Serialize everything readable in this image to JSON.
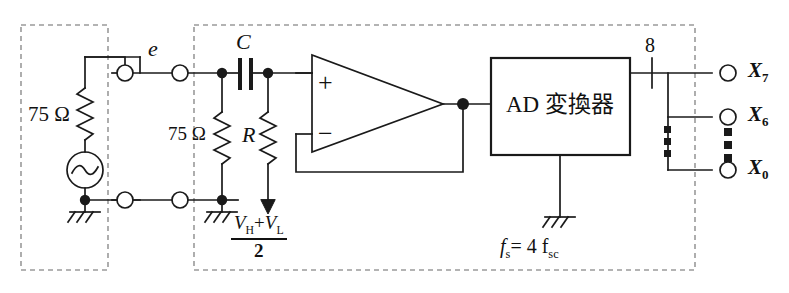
{
  "figure": {
    "type": "circuit-schematic"
  },
  "labels": {
    "source_impedance": "75 Ω",
    "termination_impedance": "75 Ω",
    "input_signal": "e",
    "capacitor": "C",
    "resistor": "R",
    "opamp_plus": "+",
    "opamp_minus": "−",
    "ad_converter": "AD 変換器",
    "bus_width": "8",
    "sampling_freq_label": "f",
    "sampling_freq_sub": "s",
    "sampling_freq_value": "= 4 f",
    "sampling_freq_value_sub": "sc",
    "bias_numerator_v1": "V",
    "bias_numerator_v1_sub": "H",
    "bias_numerator_plus": "+",
    "bias_numerator_v2": "V",
    "bias_numerator_v2_sub": "L",
    "bias_denominator": "2"
  },
  "outputs": [
    {
      "name": "X",
      "subscript": "7"
    },
    {
      "name": "X",
      "subscript": "6"
    },
    {
      "name": "X",
      "subscript": "0"
    }
  ],
  "groups": [
    {
      "id": "source-block",
      "caption": ""
    },
    {
      "id": "processing-block",
      "caption": ""
    }
  ],
  "colors": {
    "line": "#1a1a1a",
    "dashed": "#9a9a9a",
    "background": "#ffffff",
    "text": "#111111"
  }
}
